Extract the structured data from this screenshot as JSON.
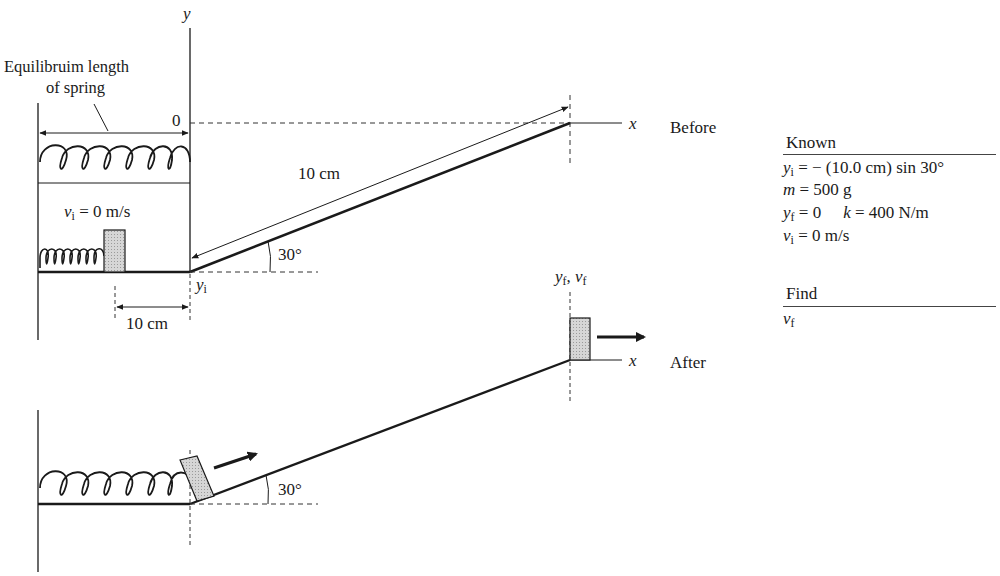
{
  "figure": {
    "axis_labels": {
      "y": "y",
      "x_before": "x",
      "x_after": "x",
      "origin": "0"
    },
    "equilibrium_label": [
      "Equilibruim length",
      "of spring"
    ],
    "initial_velocity_label": {
      "var": "v",
      "sub": "i",
      "rest": " = 0 m/s"
    },
    "incline_length_label": "10 cm",
    "compression_label": "10 cm",
    "angle_top": "30°",
    "angle_bottom": "30°",
    "yi_label": {
      "var": "y",
      "sub": "i"
    },
    "yf_vf_label": {
      "var1": "y",
      "sub1": "f",
      "sep": ", ",
      "var2": "v",
      "sub2": "f"
    },
    "state_before": "Before",
    "state_after": "After",
    "colors": {
      "line": "#1a1a1a",
      "block_fill": "#cfcfcf",
      "dash": "#333333"
    }
  },
  "known": {
    "title": "Known",
    "rows": [
      {
        "var": "y",
        "sub": "i",
        "rest": " = − (10.0 cm) sin 30°"
      },
      {
        "var": "m",
        "sub": "",
        "rest": " = 500 g"
      },
      {
        "var": "y",
        "sub": "f",
        "rest": " = 0",
        "extra_var": "k",
        "extra_rest": " = 400 N/m"
      },
      {
        "var": "v",
        "sub": "i",
        "rest": " = 0 m/s"
      }
    ]
  },
  "find": {
    "title": "Find",
    "rows": [
      {
        "var": "v",
        "sub": "f"
      }
    ]
  }
}
